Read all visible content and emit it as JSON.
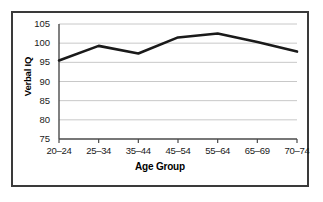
{
  "chart_data": {
    "type": "line",
    "title": "",
    "xlabel": "Age Group",
    "ylabel": "Verbal IQ",
    "categories": [
      "20–24",
      "25–34",
      "35–44",
      "45–54",
      "55–64",
      "65–69",
      "70–74"
    ],
    "values": [
      95.5,
      99.3,
      97.3,
      101.5,
      102.5,
      100.3,
      97.8
    ],
    "series": [
      {
        "name": "Verbal IQ",
        "values": [
          95.5,
          99.3,
          97.3,
          101.5,
          102.5,
          100.3,
          97.8
        ]
      }
    ],
    "ylim": [
      75,
      105
    ],
    "yticks": [
      75,
      80,
      85,
      90,
      95,
      100,
      105
    ],
    "ytick_labels": [
      "75",
      "80",
      "85",
      "90",
      "95",
      "100",
      "105"
    ],
    "grid": true,
    "grid_axis": "y",
    "legend": false,
    "legend_position": "none",
    "colors": {
      "line": "#1a1a1a",
      "grid": "#c8c8c8",
      "axis": "#4a4a4a",
      "frame": "#3a3a3a",
      "background": "#ffffff",
      "text": "#000000"
    },
    "line_width": 2.6
  }
}
